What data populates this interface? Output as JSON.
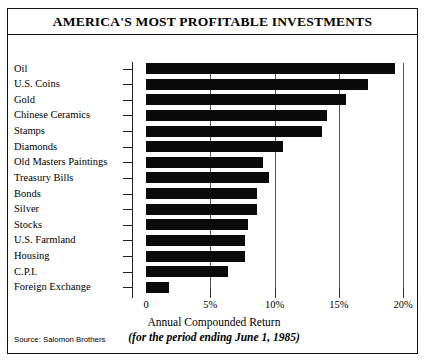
{
  "chart_data": {
    "type": "bar",
    "orientation": "horizontal",
    "title": "AMERICA'S MOST PROFITABLE INVESTMENTS",
    "xlabel": "Annual Compounded Return",
    "xlabel_note": "(for the period ending June 1, 1985)",
    "ylabel": "",
    "source": "Source: Salomon Brothers",
    "xlim": [
      0,
      20.5
    ],
    "xticks": [
      0,
      5,
      10,
      15,
      20
    ],
    "xtick_labels": [
      "0",
      "5%",
      "10%",
      "15%",
      "20%"
    ],
    "grid": true,
    "legend": null,
    "bar_color": "#0a0a0a",
    "categories": [
      "Oil",
      "U.S. Coins",
      "Gold",
      "Chinese Ceramics",
      "Stamps",
      "Diamonds",
      "Old Masters Paintings",
      "Treasury Bills",
      "Bonds",
      "Silver",
      "Stocks",
      "U.S. Farmland",
      "Housing",
      "C.P.I.",
      "Foreign Exchange"
    ],
    "values": [
      19.4,
      17.3,
      15.6,
      14.1,
      13.7,
      10.7,
      9.1,
      9.6,
      8.6,
      8.6,
      7.9,
      7.7,
      7.7,
      6.4,
      1.8
    ]
  }
}
